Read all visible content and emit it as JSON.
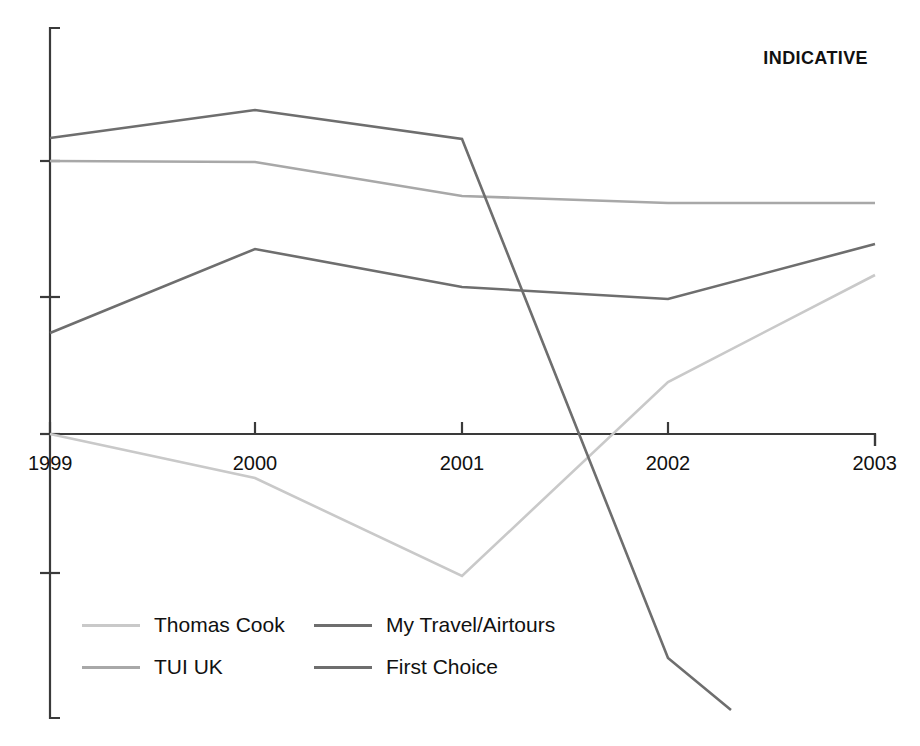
{
  "annotation": {
    "indicative": "INDICATIVE"
  },
  "axis": {
    "x_labels": [
      "1999",
      "2000",
      "2001",
      "2002",
      "2003"
    ],
    "x_label_1999": "1999",
    "x_label_2000": "2000",
    "x_label_2001": "2001",
    "x_label_2002": "2002",
    "x_label_2003": "2003"
  },
  "legend": {
    "items": [
      {
        "label": "Thomas Cook",
        "color": "#c9c9c9"
      },
      {
        "label": "My Travel/Airtours",
        "color": "#6e6e6e"
      },
      {
        "label": "TUI UK",
        "color": "#a8a8a8"
      },
      {
        "label": "First Choice",
        "color": "#6e6e6e"
      }
    ],
    "thomas_cook": "Thomas Cook",
    "my_travel": "My Travel/Airtours",
    "tui_uk": "TUI UK",
    "first_choice": "First Choice"
  },
  "colors": {
    "axis": "#3a3a3a",
    "text": "#111111",
    "thomas_cook": "#c9c9c9",
    "tui_uk": "#a8a8a8",
    "my_travel": "#6e6e6e",
    "first_choice": "#6e6e6e",
    "background": "#ffffff"
  },
  "chart_data": {
    "type": "line",
    "title": "",
    "subtitle": "",
    "annotations": [
      "INDICATIVE"
    ],
    "xlabel": "",
    "ylabel": "",
    "x": [
      "1999",
      "2000",
      "2001",
      "2002",
      "2003"
    ],
    "categories": [
      "1999",
      "2000",
      "2001",
      "2002",
      "2003"
    ],
    "grid": false,
    "legend_position": "bottom-left",
    "y_axis_labeled": false,
    "y_tick_count": 4,
    "ylim": [
      -2.1,
      3.0
    ],
    "series": [
      {
        "name": "Thomas Cook",
        "color": "#c9c9c9",
        "values": [
          0.0,
          -0.32,
          -1.04,
          -0.38,
          1.16
        ]
      },
      {
        "name": "TUI UK",
        "color": "#a8a8a8",
        "values": [
          2.0,
          1.99,
          1.74,
          1.69,
          1.69
        ]
      },
      {
        "name": "My Travel/Airtours",
        "color": "#6e6e6e",
        "values": [
          0.74,
          1.35,
          1.0,
          0.95,
          1.39
        ]
      },
      {
        "name": "First Choice",
        "color": "#6e6e6e",
        "values": [
          2.16,
          2.37,
          2.16,
          -1.62,
          -2.02
        ]
      }
    ],
    "series_pixel_paths": {
      "Thomas Cook": [
        [
          50,
          434
        ],
        [
          255,
          478
        ],
        [
          462,
          576
        ],
        [
          668,
          382
        ],
        [
          875,
          275
        ]
      ],
      "TUI UK": [
        [
          50,
          161
        ],
        [
          255,
          162
        ],
        [
          462,
          196
        ],
        [
          668,
          203
        ],
        [
          875,
          203
        ]
      ],
      "My Travel/Airtours": [
        [
          50,
          333
        ],
        [
          255,
          249
        ],
        [
          462,
          287
        ],
        [
          668,
          299
        ],
        [
          875,
          244
        ]
      ],
      "First Choice": [
        [
          50,
          138
        ],
        [
          255,
          110
        ],
        [
          462,
          139
        ],
        [
          668,
          658
        ],
        [
          731,
          710
        ]
      ]
    },
    "x_pixel_positions": [
      50,
      255,
      462,
      668,
      875
    ],
    "y_tick_pixel_positions": [
      161,
      297,
      434,
      573
    ],
    "first_choice_truncated": true
  }
}
